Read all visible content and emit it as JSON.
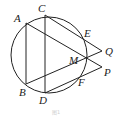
{
  "figure": {
    "type": "geometry-diagram",
    "caption": "图1",
    "stroke_color": "#222222",
    "circle": {
      "cx": 49,
      "cy": 55,
      "r": 38
    },
    "points": {
      "A": {
        "label": "A",
        "x": 26,
        "y": 23
      },
      "B": {
        "label": "B",
        "x": 26,
        "y": 84
      },
      "C": {
        "label": "C",
        "x": 45,
        "y": 15
      },
      "D": {
        "label": "D",
        "x": 45,
        "y": 93
      },
      "E": {
        "label": "E",
        "x": 85,
        "y": 39
      },
      "F": {
        "label": "F",
        "x": 80,
        "y": 76
      },
      "M": {
        "label": "M",
        "x": 86,
        "y": 59
      },
      "Q": {
        "label": "Q",
        "x": 102,
        "y": 51
      },
      "P": {
        "label": "P",
        "x": 102,
        "y": 67
      }
    },
    "segments": [
      [
        "A",
        "B"
      ],
      [
        "C",
        "D"
      ],
      [
        "A",
        "P"
      ],
      [
        "B",
        "Q"
      ],
      [
        "C",
        "Q"
      ],
      [
        "D",
        "P"
      ]
    ]
  }
}
